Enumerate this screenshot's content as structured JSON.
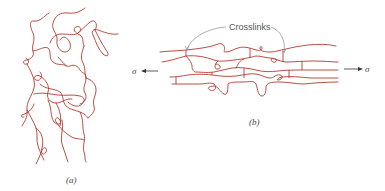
{
  "figure": {
    "panel_a": {
      "label": "(a)",
      "description": "randomly coiled crosslinked polymer chains (unstressed)"
    },
    "panel_b": {
      "label": "(b)",
      "description": "aligned crosslinked polymer chains under stress",
      "crosslinks_label": "Crosslinks",
      "stress_left_symbol": "σ",
      "stress_right_symbol": "σ"
    },
    "colors": {
      "chain": "#b5392f",
      "pointer": "#8a8a8a",
      "arrow": "#333333",
      "background": "#ffffff"
    }
  }
}
